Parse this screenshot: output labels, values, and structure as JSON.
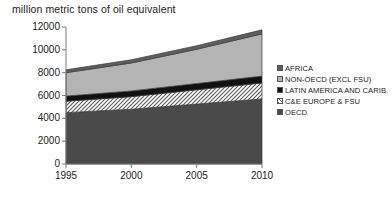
{
  "chart_data": {
    "type": "area",
    "title": "million metric tons of oil equivalent",
    "xlabel": "",
    "ylabel": "million metric tons of oil equivalent",
    "x": [
      1995,
      2000,
      2005,
      2010
    ],
    "xtick_labels": [
      "1995",
      "2000",
      "2005",
      "2010"
    ],
    "ytick_labels": [
      "0",
      "2000",
      "4000",
      "6000",
      "8000",
      "10000",
      "12000"
    ],
    "yticks": [
      0,
      2000,
      4000,
      6000,
      8000,
      10000,
      12000
    ],
    "ylim": [
      0,
      12000
    ],
    "xlim": [
      1995,
      2010
    ],
    "stacked": true,
    "grid": false,
    "legend_position": "right",
    "series": [
      {
        "name": "OECD",
        "values": [
          4500,
          4800,
          5250,
          5700
        ],
        "color": "#4a4a4a",
        "fill": "solid"
      },
      {
        "name": "C&E EUROPE & FSU",
        "values": [
          1000,
          1100,
          1250,
          1400
        ],
        "color": "#e8e8e8",
        "fill": "hatch"
      },
      {
        "name": "LATIN AMERICA AND CARIB.",
        "values": [
          450,
          500,
          550,
          600
        ],
        "color": "#111111",
        "fill": "solid"
      },
      {
        "name": "NON-OECD (EXCL FSU)",
        "values": [
          2050,
          2450,
          3000,
          3700
        ],
        "color": "#b4b4b4",
        "fill": "solid"
      },
      {
        "name": "AFRICA",
        "values": [
          250,
          280,
          310,
          350
        ],
        "color": "#5e5e5e",
        "fill": "solid"
      }
    ],
    "totals": [
      8250,
      9130,
      10360,
      11750
    ]
  },
  "legend": {
    "items": [
      {
        "label": "AFRICA",
        "color": "#5e5e5e"
      },
      {
        "label": "NON-OECD (EXCL FSU)",
        "color": "#b4b4b4"
      },
      {
        "label": "LATIN AMERICA AND CARIB.",
        "color": "#111111"
      },
      {
        "label": "C&E EUROPE & FSU",
        "color": "#e8e8e8"
      },
      {
        "label": "OECD",
        "color": "#4a4a4a"
      }
    ]
  }
}
